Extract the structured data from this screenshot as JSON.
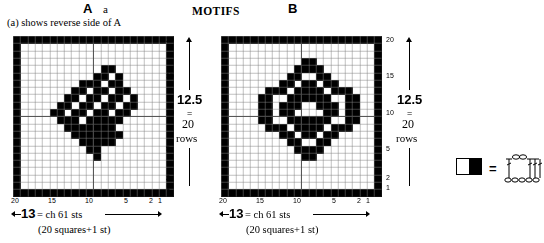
{
  "headings": {
    "chart_a_title": "A",
    "chart_a_subtitle": "a",
    "center_title": "MOTIFS",
    "chart_b_title": "B",
    "reverse_note": "(a) shows reverse side of A"
  },
  "charts": [
    {
      "id": "A",
      "name": "chart-a",
      "right_axis_labels": [
        "20",
        "15",
        "10",
        "5",
        "2",
        "1"
      ],
      "bottom_axis_labels": [
        "20",
        "15",
        "10",
        "5",
        "2",
        "1"
      ],
      "height_measure": {
        "value": "12.5",
        "equals": "=",
        "count": "20",
        "unit": "rows"
      },
      "width_measure": {
        "value": "13",
        "equals": "= ch 61 sts",
        "sub": "(20 squares+1 st)"
      }
    },
    {
      "id": "B",
      "name": "chart-b",
      "right_axis_labels": [
        "20",
        "15",
        "10",
        "5",
        "2",
        "1"
      ],
      "bottom_axis_labels": [
        "20",
        "15",
        "10",
        "5",
        "2",
        "1"
      ],
      "height_measure": {
        "value": "12.5",
        "equals": "=",
        "count": "20",
        "unit": "rows"
      },
      "width_measure": {
        "value": "13",
        "equals": "= ch 61 sts",
        "sub": "(20 squares+1 st)"
      }
    }
  ],
  "legend": {
    "swatch_name": "half-filled-square",
    "equals": "=",
    "diagram_name": "crochet-stitch-diagram"
  },
  "chart_data": {
    "type": "heatmap",
    "title": "MOTIFS",
    "grid_columns": 22,
    "grid_rows": 22,
    "cell_px": 7.3,
    "colors": {
      "filled": "#000000",
      "empty": "#ffffff",
      "gridline": "#808080",
      "border": "#000000"
    },
    "axis_ranges": {
      "x": [
        1,
        20
      ],
      "y": [
        1,
        20
      ]
    },
    "grids": {
      "A": [
        [
          1,
          1,
          1,
          1,
          1,
          1,
          1,
          1,
          1,
          1,
          1,
          1,
          1,
          1,
          1,
          1,
          1,
          1,
          1,
          1,
          1,
          1
        ],
        [
          1,
          0,
          0,
          0,
          0,
          0,
          0,
          0,
          0,
          0,
          0,
          0,
          0,
          0,
          0,
          0,
          0,
          0,
          0,
          0,
          0,
          1
        ],
        [
          1,
          0,
          0,
          0,
          0,
          0,
          0,
          0,
          0,
          0,
          0,
          0,
          0,
          0,
          0,
          0,
          0,
          0,
          0,
          0,
          0,
          1
        ],
        [
          1,
          0,
          0,
          0,
          0,
          0,
          0,
          0,
          0,
          0,
          0,
          0,
          0,
          0,
          0,
          0,
          0,
          0,
          0,
          0,
          0,
          1
        ],
        [
          1,
          0,
          0,
          0,
          0,
          0,
          0,
          0,
          0,
          0,
          0,
          0,
          1,
          1,
          0,
          0,
          0,
          0,
          0,
          0,
          0,
          1
        ],
        [
          1,
          0,
          0,
          0,
          0,
          0,
          0,
          0,
          0,
          0,
          0,
          1,
          1,
          0,
          1,
          0,
          0,
          0,
          0,
          0,
          0,
          1
        ],
        [
          1,
          0,
          0,
          0,
          0,
          0,
          0,
          0,
          0,
          1,
          1,
          1,
          0,
          1,
          1,
          0,
          0,
          0,
          0,
          0,
          0,
          1
        ],
        [
          1,
          0,
          0,
          0,
          0,
          0,
          0,
          0,
          1,
          1,
          0,
          1,
          1,
          0,
          1,
          1,
          0,
          0,
          0,
          0,
          0,
          1
        ],
        [
          1,
          0,
          0,
          0,
          0,
          0,
          0,
          1,
          1,
          0,
          1,
          1,
          0,
          1,
          1,
          0,
          1,
          0,
          0,
          0,
          0,
          1
        ],
        [
          1,
          0,
          0,
          0,
          0,
          0,
          1,
          1,
          0,
          1,
          1,
          0,
          1,
          1,
          0,
          1,
          1,
          0,
          0,
          0,
          0,
          1
        ],
        [
          1,
          0,
          0,
          0,
          0,
          1,
          1,
          0,
          1,
          1,
          0,
          1,
          1,
          0,
          1,
          1,
          0,
          0,
          0,
          0,
          0,
          1
        ],
        [
          1,
          0,
          0,
          0,
          0,
          0,
          1,
          1,
          1,
          0,
          1,
          1,
          1,
          1,
          1,
          0,
          0,
          0,
          0,
          0,
          0,
          1
        ],
        [
          1,
          0,
          0,
          0,
          0,
          0,
          0,
          1,
          1,
          1,
          1,
          1,
          1,
          1,
          0,
          0,
          0,
          0,
          0,
          0,
          0,
          1
        ],
        [
          1,
          0,
          0,
          0,
          0,
          0,
          0,
          0,
          1,
          1,
          1,
          1,
          1,
          1,
          1,
          0,
          0,
          0,
          0,
          0,
          0,
          1
        ],
        [
          1,
          0,
          0,
          0,
          0,
          0,
          0,
          0,
          0,
          1,
          1,
          1,
          1,
          1,
          0,
          0,
          0,
          0,
          0,
          0,
          0,
          1
        ],
        [
          1,
          0,
          0,
          0,
          0,
          0,
          0,
          0,
          0,
          0,
          1,
          1,
          0,
          0,
          0,
          0,
          0,
          0,
          0,
          0,
          0,
          1
        ],
        [
          1,
          0,
          0,
          0,
          0,
          0,
          0,
          0,
          0,
          0,
          0,
          1,
          0,
          0,
          0,
          0,
          0,
          0,
          0,
          0,
          0,
          1
        ],
        [
          1,
          0,
          0,
          0,
          0,
          0,
          0,
          0,
          0,
          0,
          0,
          0,
          0,
          0,
          0,
          0,
          0,
          0,
          0,
          0,
          0,
          1
        ],
        [
          1,
          0,
          0,
          0,
          0,
          0,
          0,
          0,
          0,
          0,
          0,
          0,
          0,
          0,
          0,
          0,
          0,
          0,
          0,
          0,
          0,
          1
        ],
        [
          1,
          0,
          0,
          0,
          0,
          0,
          0,
          0,
          0,
          0,
          0,
          0,
          0,
          0,
          0,
          0,
          0,
          0,
          0,
          0,
          0,
          1
        ],
        [
          1,
          0,
          0,
          0,
          0,
          0,
          0,
          0,
          0,
          0,
          0,
          0,
          0,
          0,
          0,
          0,
          0,
          0,
          0,
          0,
          0,
          1
        ],
        [
          1,
          1,
          1,
          1,
          1,
          1,
          1,
          1,
          1,
          1,
          1,
          1,
          1,
          1,
          1,
          1,
          1,
          1,
          1,
          1,
          1,
          1
        ]
      ],
      "B": [
        [
          1,
          1,
          1,
          1,
          1,
          1,
          1,
          1,
          1,
          1,
          1,
          1,
          1,
          1,
          1,
          1,
          1,
          1,
          1,
          1,
          1,
          1
        ],
        [
          1,
          0,
          0,
          0,
          0,
          0,
          0,
          0,
          0,
          0,
          0,
          0,
          0,
          0,
          0,
          0,
          0,
          0,
          0,
          0,
          0,
          1
        ],
        [
          1,
          0,
          0,
          0,
          0,
          0,
          0,
          0,
          0,
          0,
          0,
          0,
          0,
          0,
          0,
          0,
          0,
          0,
          0,
          0,
          0,
          1
        ],
        [
          1,
          0,
          0,
          0,
          0,
          0,
          0,
          0,
          0,
          0,
          0,
          1,
          1,
          0,
          0,
          0,
          0,
          0,
          0,
          0,
          0,
          1
        ],
        [
          1,
          0,
          0,
          0,
          0,
          0,
          0,
          0,
          0,
          0,
          1,
          1,
          1,
          1,
          0,
          0,
          0,
          0,
          0,
          0,
          0,
          1
        ],
        [
          1,
          0,
          0,
          0,
          0,
          0,
          0,
          0,
          0,
          1,
          1,
          0,
          0,
          1,
          1,
          0,
          0,
          0,
          0,
          0,
          0,
          1
        ],
        [
          1,
          0,
          0,
          0,
          0,
          0,
          0,
          0,
          1,
          1,
          0,
          1,
          1,
          0,
          1,
          1,
          0,
          0,
          0,
          0,
          0,
          1
        ],
        [
          1,
          0,
          0,
          0,
          0,
          0,
          1,
          1,
          1,
          0,
          1,
          1,
          1,
          1,
          0,
          1,
          1,
          1,
          0,
          0,
          0,
          1
        ],
        [
          1,
          0,
          0,
          0,
          0,
          1,
          1,
          0,
          0,
          1,
          1,
          1,
          1,
          1,
          1,
          0,
          0,
          1,
          1,
          0,
          0,
          1
        ],
        [
          1,
          0,
          0,
          0,
          0,
          1,
          1,
          0,
          1,
          1,
          1,
          0,
          0,
          1,
          1,
          1,
          0,
          1,
          1,
          0,
          0,
          1
        ],
        [
          1,
          0,
          0,
          0,
          0,
          1,
          1,
          0,
          1,
          1,
          0,
          0,
          0,
          0,
          1,
          1,
          0,
          1,
          1,
          0,
          0,
          1
        ],
        [
          1,
          0,
          0,
          0,
          0,
          1,
          1,
          0,
          0,
          1,
          1,
          1,
          1,
          1,
          1,
          0,
          0,
          1,
          1,
          0,
          0,
          1
        ],
        [
          1,
          0,
          0,
          0,
          0,
          0,
          1,
          1,
          1,
          0,
          1,
          1,
          1,
          1,
          0,
          1,
          1,
          1,
          0,
          0,
          0,
          1
        ],
        [
          1,
          0,
          0,
          0,
          0,
          0,
          0,
          0,
          1,
          1,
          0,
          1,
          1,
          0,
          1,
          1,
          0,
          0,
          0,
          0,
          0,
          1
        ],
        [
          1,
          0,
          0,
          0,
          0,
          0,
          0,
          0,
          0,
          1,
          1,
          0,
          0,
          1,
          1,
          0,
          0,
          0,
          0,
          0,
          0,
          1
        ],
        [
          1,
          0,
          0,
          0,
          0,
          0,
          0,
          0,
          0,
          0,
          1,
          1,
          1,
          1,
          0,
          0,
          0,
          0,
          0,
          0,
          0,
          1
        ],
        [
          1,
          0,
          0,
          0,
          0,
          0,
          0,
          0,
          0,
          0,
          0,
          1,
          1,
          0,
          0,
          0,
          0,
          0,
          0,
          0,
          0,
          1
        ],
        [
          1,
          0,
          0,
          0,
          0,
          0,
          0,
          0,
          0,
          0,
          0,
          0,
          0,
          0,
          0,
          0,
          0,
          0,
          0,
          0,
          0,
          1
        ],
        [
          1,
          0,
          0,
          0,
          0,
          0,
          0,
          0,
          0,
          0,
          0,
          0,
          0,
          0,
          0,
          0,
          0,
          0,
          0,
          0,
          0,
          1
        ],
        [
          1,
          0,
          0,
          0,
          0,
          0,
          0,
          0,
          0,
          0,
          0,
          0,
          0,
          0,
          0,
          0,
          0,
          0,
          0,
          0,
          0,
          1
        ],
        [
          1,
          0,
          0,
          0,
          0,
          0,
          0,
          0,
          0,
          0,
          0,
          0,
          0,
          0,
          0,
          0,
          0,
          0,
          0,
          0,
          0,
          1
        ],
        [
          1,
          1,
          1,
          1,
          1,
          1,
          1,
          1,
          1,
          1,
          1,
          1,
          1,
          1,
          1,
          1,
          1,
          1,
          1,
          1,
          1,
          1
        ]
      ]
    }
  }
}
